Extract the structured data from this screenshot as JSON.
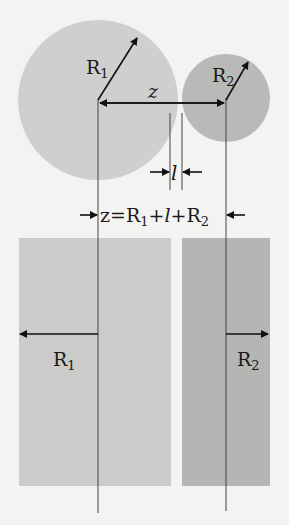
{
  "colors": {
    "background": "#f3f3f1",
    "sphere1": "#cfcfcd",
    "sphere2": "#b9b9b7",
    "slab1": "#cbcbc9",
    "slab2": "#b5b5b3",
    "line": "#444444",
    "arrow": "#111111"
  },
  "labels": {
    "r1_top": "R",
    "r1_top_sub": "1",
    "r2_top": "R",
    "r2_top_sub": "2",
    "z": "z",
    "l": "l",
    "equation_z": "z",
    "equation_eq": "=",
    "equation_r1": "R",
    "equation_r1_sub": "1",
    "equation_plus1": "+",
    "equation_l": "l",
    "equation_plus2": "+",
    "equation_r2": "R",
    "equation_r2_sub": "2",
    "r1_bottom": "R",
    "r1_bottom_sub": "1",
    "r2_bottom": "R",
    "r2_bottom_sub": "2"
  }
}
